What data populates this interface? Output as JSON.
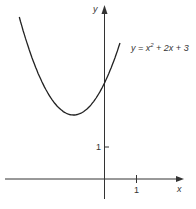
{
  "chart_data": {
    "type": "line",
    "title": "",
    "xlabel": "x",
    "ylabel": "y",
    "annotation": "y = x² + 2x + 3",
    "series": [
      {
        "name": "y = x^2 + 2x + 3",
        "x": [
          -2.75,
          -2.5,
          -2.0,
          -1.5,
          -1.0,
          -0.5,
          0.0,
          0.25,
          0.5
        ],
        "values": [
          5.06,
          4.25,
          3.0,
          2.25,
          2.0,
          2.25,
          3.0,
          3.56,
          4.25
        ]
      }
    ],
    "x_ticks": [
      {
        "value": 1,
        "label": "1"
      }
    ],
    "y_ticks": [
      {
        "value": 1,
        "label": "1"
      }
    ],
    "xlim": [
      -3.2,
      1.5
    ],
    "ylim": [
      -0.6,
      5.4
    ],
    "grid": false,
    "vertex": {
      "x": -1,
      "y": 2
    },
    "y_intercept": 3
  },
  "labels": {
    "x_axis": "x",
    "y_axis": "y",
    "x_tick_1": "1",
    "y_tick_1": "1",
    "equation_prefix": "y = x",
    "equation_exp": "2",
    "equation_suffix": " + 2x + 3"
  }
}
